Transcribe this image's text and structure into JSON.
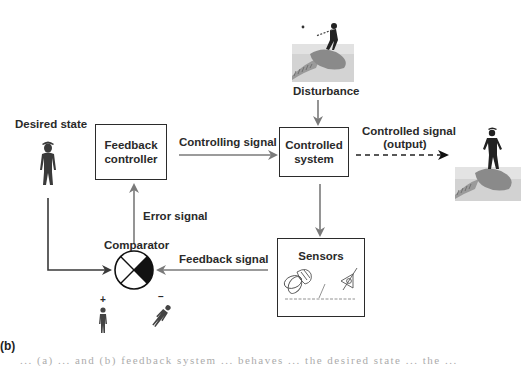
{
  "diagram": {
    "type": "feedback-control-loop",
    "panel_label": "(b)",
    "nodes": {
      "desired_state": {
        "label": "Desired state",
        "icon": "standing-person-icon"
      },
      "feedback_controller": {
        "line1": "Feedback",
        "line2": "controller"
      },
      "controlled_system": {
        "line1": "Controlled",
        "line2": "system"
      },
      "sensors": {
        "label": "Sensors",
        "icons": [
          "inner-ear-icon",
          "eye-icon",
          "skin-receptor-icon"
        ]
      },
      "comparator": {
        "label": "Comparator",
        "plus_sign": "+",
        "minus_sign": "–"
      },
      "disturbance": {
        "label": "Disturbance",
        "icon": "surfer-falling-icon"
      },
      "output": {
        "icon": "surfer-balanced-icon"
      }
    },
    "edges": {
      "controlling_signal": {
        "label": "Controlling signal",
        "from": "feedback_controller",
        "to": "controlled_system"
      },
      "controlled_signal": {
        "line1": "Controlled signal",
        "line2": "(output)",
        "from": "controlled_system",
        "to": "output",
        "style": "dashed"
      },
      "disturbance_in": {
        "from": "disturbance",
        "to": "controlled_system"
      },
      "to_sensors": {
        "from": "controlled_system",
        "to": "sensors"
      },
      "feedback_signal": {
        "label": "Feedback signal",
        "from": "sensors",
        "to": "comparator"
      },
      "error_signal": {
        "label": "Error signal",
        "from": "comparator",
        "to": "feedback_controller"
      },
      "desired_in": {
        "from": "desired_state",
        "to": "comparator"
      }
    },
    "colors": {
      "box_border": "#2b2b2b",
      "arrow_gray": "#7a7a7a",
      "arrow_dark": "#3a3a3a",
      "text": "#2a2a2a",
      "comparator_fill": "#111111"
    }
  },
  "caption": {
    "text": "... (a) ... and (b) feedback system ... behaves ... the desired state ... the ..."
  }
}
